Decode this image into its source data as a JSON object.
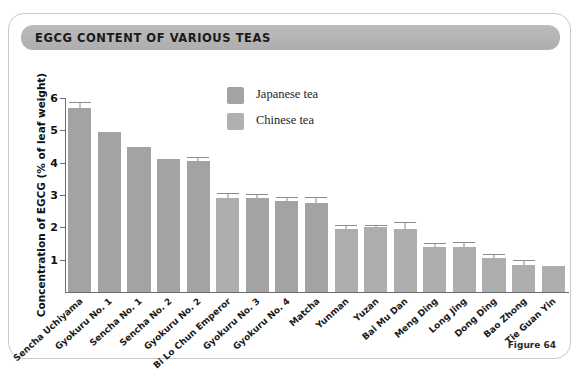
{
  "figure": {
    "title": "EGCG CONTENT OF VARIOUS TEAS",
    "caption": "Figure 64"
  },
  "legend": {
    "position": "top-center",
    "items": [
      {
        "label": "Japanese tea",
        "color": "#a3a3a3",
        "key": "japanese"
      },
      {
        "label": "Chinese tea",
        "color": "#b0b0b0",
        "key": "chinese"
      }
    ]
  },
  "chart_data": {
    "type": "bar",
    "title": "EGCG CONTENT OF VARIOUS TEAS",
    "xlabel": "",
    "ylabel": "Concentration of EGCG  (% of leaf weight)",
    "ylim": [
      0,
      6
    ],
    "yticks": [
      1,
      2,
      3,
      4,
      5,
      6
    ],
    "grid": false,
    "categories": [
      "Sencha Uchiyama",
      "Gyokuru No. 1",
      "Sencha No. 1",
      "Sencha No. 2",
      "Gyokuru No. 2",
      "Bi Lo Chun Emperor",
      "Gyokuru No. 3",
      "Gyokuru No. 4",
      "Matcha",
      "Yunman",
      "Yuzan",
      "Bai Mu Dan",
      "Meng Ding",
      "Long Jing",
      "Dong Ding",
      "Bao Zhong",
      "Tie Guan Yin"
    ],
    "values": [
      5.7,
      4.95,
      4.5,
      4.1,
      4.05,
      2.9,
      2.9,
      2.8,
      2.75,
      1.95,
      2.0,
      1.95,
      1.4,
      1.4,
      1.05,
      0.85,
      0.8
    ],
    "errors": [
      0.15,
      0.0,
      0.0,
      0.0,
      0.1,
      0.12,
      0.1,
      0.1,
      0.15,
      0.08,
      0.05,
      0.18,
      0.07,
      0.12,
      0.1,
      0.1,
      0.0
    ],
    "groups": [
      "japanese",
      "japanese",
      "japanese",
      "japanese",
      "japanese",
      "chinese",
      "japanese",
      "japanese",
      "japanese",
      "chinese",
      "chinese",
      "chinese",
      "chinese",
      "chinese",
      "chinese",
      "chinese",
      "chinese"
    ],
    "series": [
      {
        "name": "Japanese tea",
        "color": "#a3a3a3",
        "points": [
          {
            "category": "Sencha Uchiyama",
            "value": 5.7,
            "error": 0.15
          },
          {
            "category": "Gyokuru No. 1",
            "value": 4.95,
            "error": 0.0
          },
          {
            "category": "Sencha No. 1",
            "value": 4.5,
            "error": 0.0
          },
          {
            "category": "Sencha No. 2",
            "value": 4.1,
            "error": 0.0
          },
          {
            "category": "Gyokuru No. 2",
            "value": 4.05,
            "error": 0.1
          },
          {
            "category": "Gyokuru No. 3",
            "value": 2.9,
            "error": 0.1
          },
          {
            "category": "Gyokuru No. 4",
            "value": 2.8,
            "error": 0.1
          },
          {
            "category": "Matcha",
            "value": 2.75,
            "error": 0.15
          }
        ]
      },
      {
        "name": "Chinese tea",
        "color": "#b0b0b0",
        "points": [
          {
            "category": "Bi Lo Chun Emperor",
            "value": 2.9,
            "error": 0.12
          },
          {
            "category": "Yunman",
            "value": 1.95,
            "error": 0.08
          },
          {
            "category": "Yuzan",
            "value": 2.0,
            "error": 0.05
          },
          {
            "category": "Bai Mu Dan",
            "value": 1.95,
            "error": 0.18
          },
          {
            "category": "Meng Ding",
            "value": 1.4,
            "error": 0.07
          },
          {
            "category": "Long Jing",
            "value": 1.4,
            "error": 0.12
          },
          {
            "category": "Dong Ding",
            "value": 1.05,
            "error": 0.1
          },
          {
            "category": "Bao Zhong",
            "value": 0.85,
            "error": 0.1
          },
          {
            "category": "Tie Guan Yin",
            "value": 0.8,
            "error": 0.0
          }
        ]
      }
    ]
  }
}
